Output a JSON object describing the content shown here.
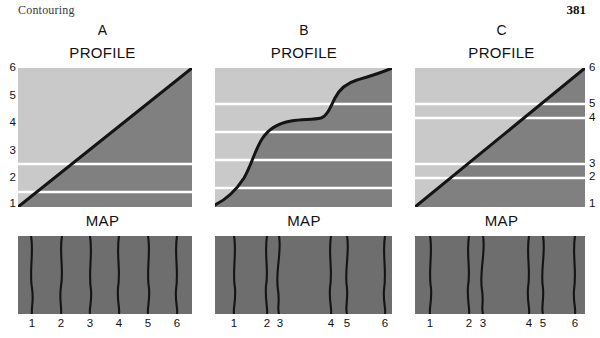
{
  "header": {
    "running_head": "Contouring",
    "page_number": "381"
  },
  "section_titles": {
    "profile": "PROFILE",
    "map": "MAP"
  },
  "panels": [
    {
      "letter": "A",
      "description": "uniform slope",
      "profile": {
        "y_labels": [
          "6",
          "5",
          "4",
          "3",
          "2",
          "1"
        ],
        "y_label_side": "left",
        "y_label_positions_px": [
          67,
          95,
          122,
          150,
          177,
          203
        ],
        "gridline_levels": [
          "5",
          "4",
          "3",
          "2"
        ],
        "gridline_y_px": [
          96,
          124,
          152,
          180
        ],
        "terrain_profile_points": [
          [
            0,
            139
          ],
          [
            174,
            0
          ]
        ],
        "upper_fill": "#c9c9c9",
        "lower_fill": "#808080"
      },
      "map": {
        "x_labels": [
          "1",
          "2",
          "3",
          "4",
          "5",
          "6"
        ],
        "contour_x_px": [
          14,
          43,
          72,
          101,
          130,
          159
        ],
        "label_x_px": [
          14,
          43,
          72,
          101,
          130,
          159
        ],
        "spacing": "even",
        "fill": "#6e6e6e"
      }
    },
    {
      "letter": "B",
      "description": "stepped slope with two steep benches",
      "profile": {
        "y_labels": [],
        "y_label_side": "none",
        "gridline_levels": [
          "5",
          "4",
          "3",
          "2"
        ],
        "gridline_y_px": [
          36,
          64,
          92,
          120
        ],
        "terrain_profile_points": [
          [
            0,
            137
          ],
          [
            14,
            128
          ],
          [
            26,
            116
          ],
          [
            36,
            100
          ],
          [
            44,
            80
          ],
          [
            52,
            64
          ],
          [
            62,
            54
          ],
          [
            74,
            50
          ],
          [
            92,
            49
          ],
          [
            104,
            48
          ],
          [
            110,
            44
          ],
          [
            116,
            34
          ],
          [
            124,
            22
          ],
          [
            134,
            14
          ],
          [
            148,
            10
          ],
          [
            162,
            5
          ],
          [
            177,
            0
          ]
        ],
        "upper_fill": "#c9c9c9",
        "lower_fill": "#808080"
      },
      "map": {
        "x_labels": [
          "1",
          "2",
          "3",
          "4",
          "5",
          "6"
        ],
        "contour_x_px": [
          20,
          52,
          64,
          116,
          132,
          170
        ],
        "label_x_px": [
          20,
          52,
          64,
          116,
          132,
          170
        ],
        "spacing": "paired",
        "fill": "#6e6e6e"
      }
    },
    {
      "letter": "C",
      "description": "uniform slope with unevenly spaced contour intervals",
      "profile": {
        "y_labels": [
          "6",
          "5",
          "4",
          "3",
          "2",
          "1"
        ],
        "y_label_side": "right",
        "y_label_positions_px": [
          67,
          103,
          117,
          163,
          176,
          203
        ],
        "gridline_levels": [
          "5",
          "4",
          "3",
          "2"
        ],
        "gridline_y_px": [
          36,
          50,
          96,
          110
        ],
        "terrain_profile_points": [
          [
            0,
            139
          ],
          [
            170,
            0
          ]
        ],
        "upper_fill": "#c9c9c9",
        "lower_fill": "#808080"
      },
      "map": {
        "x_labels": [
          "1",
          "2",
          "3",
          "4",
          "5",
          "6"
        ],
        "contour_x_px": [
          16,
          54,
          68,
          114,
          128,
          160
        ],
        "label_x_px": [
          16,
          54,
          68,
          114,
          128,
          160
        ],
        "spacing": "paired",
        "fill": "#6e6e6e"
      }
    }
  ],
  "colors": {
    "sky": "#c9c9c9",
    "ground": "#808080",
    "map_ground": "#6e6e6e",
    "contour_line": "#1a1a1a",
    "gridline": "#ffffff",
    "text": "#111111"
  }
}
